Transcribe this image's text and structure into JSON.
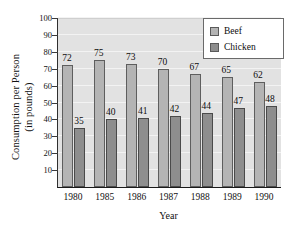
{
  "chart_data": {
    "type": "bar",
    "title": "",
    "xlabel": "Year",
    "ylabel": "Consumption per Person (in pounds)",
    "ylabel_line1": "Consumption per Person",
    "ylabel_line2": "(in pounds)",
    "categories": [
      "1980",
      "1985",
      "1986",
      "1987",
      "1988",
      "1989",
      "1990"
    ],
    "series": [
      {
        "name": "Beef",
        "values": [
          72,
          75,
          73,
          70,
          67,
          65,
          62
        ],
        "color": "#b4b4b4"
      },
      {
        "name": "Chicken",
        "values": [
          35,
          40,
          41,
          42,
          44,
          47,
          48
        ],
        "color": "#8e8e8e"
      }
    ],
    "ylim": [
      0,
      100
    ],
    "yticks": [
      10,
      20,
      30,
      40,
      50,
      60,
      70,
      80,
      90,
      100
    ],
    "ytick_labels": [
      "10",
      "20",
      "30",
      "40",
      "50",
      "60",
      "70",
      "80",
      "90",
      "100"
    ],
    "grid": true,
    "legend_position": "top-right",
    "data_labels": true,
    "plot_background": "#e2e2e2",
    "axis_color": "#1a1a1a"
  },
  "legend": {
    "items": [
      {
        "label": "Beef"
      },
      {
        "label": "Chicken"
      }
    ]
  },
  "axes": {
    "x_title": "Year",
    "y_title_line1": "Consumption per Person",
    "y_title_line2": "(in pounds)"
  }
}
